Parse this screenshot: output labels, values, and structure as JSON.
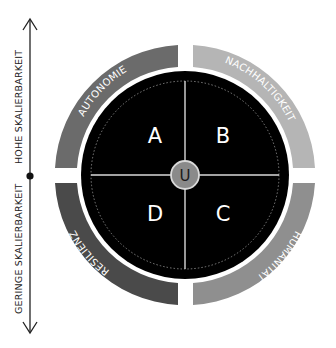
{
  "axis": {
    "top_label": "HOHE SKALIERBARKEIT",
    "bottom_label": "GERINGE SKALIERBARKEIT"
  },
  "ring_segments": [
    {
      "id": "top-left",
      "label": "AUTONOMIE",
      "color": "#6b6b6b"
    },
    {
      "id": "top-right",
      "label": "NACHHALTIGKEIT",
      "color": "#b5b5b5"
    },
    {
      "id": "bottom-right",
      "label": "HUMANITÄT",
      "color": "#8f8f8f"
    },
    {
      "id": "bottom-left",
      "label": "RESILIENZ",
      "color": "#4a4a4a"
    }
  ],
  "quadrants": {
    "a": "A",
    "b": "B",
    "c": "C",
    "d": "D"
  },
  "center": {
    "label": "U",
    "color": "#8a8a8a"
  },
  "colors": {
    "disc": "#000000",
    "divider": "#d9d9d9",
    "axis": "#222222"
  }
}
